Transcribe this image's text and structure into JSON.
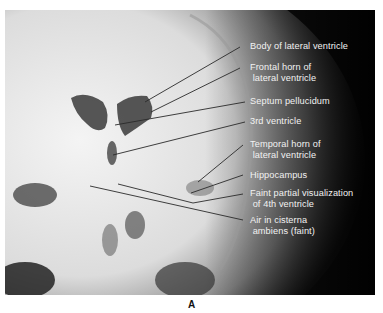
{
  "figure": {
    "caption": "A",
    "image_description": "Frontal skull radiograph (pneumoencephalogram) showing air-filled ventricles",
    "labels": [
      {
        "text": "Body of lateral ventricle"
      },
      {
        "text": "Frontal horn of\n lateral ventricle"
      },
      {
        "text": "Septum pellucidum"
      },
      {
        "text": "3rd ventricle"
      },
      {
        "text": "Temporal horn of\n lateral ventricle"
      },
      {
        "text": "Hippocampus"
      },
      {
        "text": "Faint partial visualization\n of 4th ventricle"
      },
      {
        "text": "Air in cisterna\n ambiens (faint)"
      }
    ]
  }
}
